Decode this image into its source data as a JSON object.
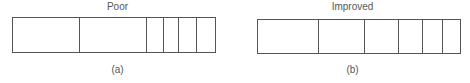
{
  "panels": [
    {
      "title": "Poor",
      "caption": "(a)",
      "box": {
        "left": 12,
        "top": 17,
        "width": 204,
        "height": 36
      },
      "segment_widths": [
        68,
        67,
        17,
        16,
        18,
        18
      ]
    },
    {
      "title": "Improved",
      "caption": "(b)",
      "box": {
        "left": 22,
        "top": 19,
        "width": 204,
        "height": 35
      },
      "segment_widths": [
        62,
        46,
        34,
        25,
        20,
        17
      ]
    }
  ],
  "colors": {
    "stroke": "#555555",
    "text": "#555555",
    "background": "#ffffff"
  }
}
